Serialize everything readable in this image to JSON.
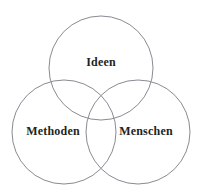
{
  "diagram": {
    "type": "venn",
    "background_color": "#ffffff",
    "stroke_color": "#8a8a92",
    "text_color": "#231f20",
    "circles": [
      {
        "id": "ideen",
        "label": "Ideen",
        "cx": 101,
        "cy": 68,
        "r": 52,
        "label_x": 101,
        "label_y": 62
      },
      {
        "id": "methoden",
        "label": "Methoden",
        "cx": 64,
        "cy": 132,
        "r": 52,
        "label_x": 53,
        "label_y": 131
      },
      {
        "id": "menschen",
        "label": "Menschen",
        "cx": 138,
        "cy": 132,
        "r": 52,
        "label_x": 146,
        "label_y": 131
      }
    ]
  }
}
